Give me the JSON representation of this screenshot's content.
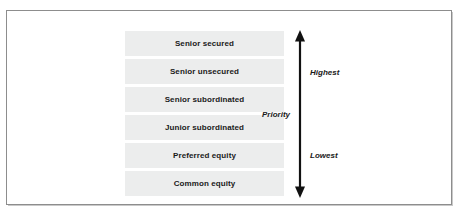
{
  "figure": {
    "type": "seniority-stack",
    "border_color": "#8d8d8d",
    "bar_fill_color": "#eceded",
    "text_color": "#1a1a1a",
    "arrow_color": "#111111"
  },
  "stack": {
    "tranches": [
      {
        "label": "Senior secured"
      },
      {
        "label": "Senior unsecured"
      },
      {
        "label": "Senior subordinated"
      },
      {
        "label": "Junior subordinated"
      },
      {
        "label": "Preferred equity"
      },
      {
        "label": "Common equity"
      }
    ]
  },
  "arrow": {
    "axis_label": "Priority",
    "top_label": "Highest",
    "bottom_label": "Lowest",
    "icon": "double-headed-vertical-arrow"
  }
}
